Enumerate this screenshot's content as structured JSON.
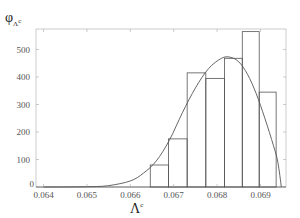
{
  "chart_data": {
    "type": "bar",
    "title": "",
    "xlabel": "Λ^c",
    "ylabel": "φ_{Λ^c}",
    "xlim": [
      0.06385,
      0.06958
    ],
    "ylim": [
      0,
      575
    ],
    "x_ticks": [
      "0.064",
      "0.065",
      "0.066",
      "0.067",
      "0.068",
      "0.069"
    ],
    "y_ticks": [
      "0",
      "100",
      "200",
      "300",
      "400",
      "500"
    ],
    "grid": false,
    "bins": [
      {
        "x0": 0.06646,
        "x1": 0.06688,
        "value": 80
      },
      {
        "x0": 0.06688,
        "x1": 0.06731,
        "value": 175
      },
      {
        "x0": 0.06731,
        "x1": 0.06774,
        "value": 415
      },
      {
        "x0": 0.06774,
        "x1": 0.06817,
        "value": 395
      },
      {
        "x0": 0.06817,
        "x1": 0.06858,
        "value": 468
      },
      {
        "x0": 0.06858,
        "x1": 0.06897,
        "value": 565
      },
      {
        "x0": 0.06897,
        "x1": 0.06936,
        "value": 345
      }
    ],
    "fitted_curve": {
      "description": "smooth density fit overlay",
      "points": [
        [
          0.064,
          0
        ],
        [
          0.065,
          1
        ],
        [
          0.0655,
          5
        ],
        [
          0.066,
          22
        ],
        [
          0.0663,
          50
        ],
        [
          0.0666,
          95
        ],
        [
          0.0669,
          170
        ],
        [
          0.0672,
          270
        ],
        [
          0.0675,
          360
        ],
        [
          0.0678,
          430
        ],
        [
          0.0681,
          468
        ],
        [
          0.0683,
          472
        ],
        [
          0.0685,
          455
        ],
        [
          0.0687,
          410
        ],
        [
          0.0689,
          340
        ],
        [
          0.0691,
          250
        ],
        [
          0.0693,
          150
        ],
        [
          0.0694,
          90
        ],
        [
          0.06948,
          0
        ]
      ]
    }
  }
}
